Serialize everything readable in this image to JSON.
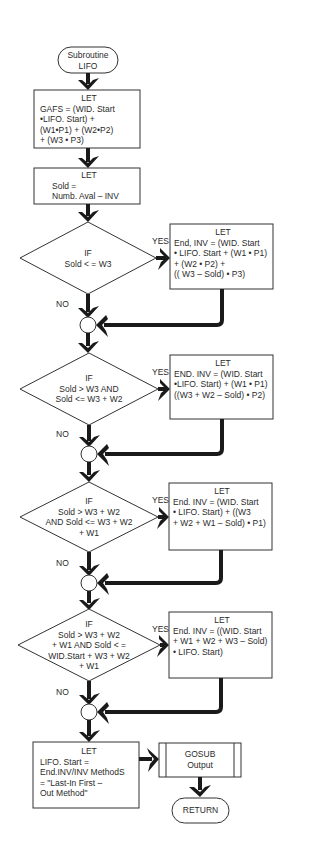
{
  "start": {
    "lines": [
      "Subroutine",
      "LIFO"
    ]
  },
  "steps": [
    {
      "header": "LET",
      "lines": [
        "GAFS = (WID. Start",
        "•LIFO. Start) +",
        "(W1•P1) + (W2•P2)",
        "+ (W3 • P3)"
      ]
    },
    {
      "header": "LET",
      "lines": [
        "Sold =",
        "Numb. Aval – INV"
      ]
    }
  ],
  "decisions": [
    {
      "lines": [
        "IF",
        "Sold < = W3"
      ],
      "yes_label": "YES",
      "no_label": "NO",
      "action": {
        "header": "LET",
        "lines": [
          "End, INV = (WID. Start",
          "• LIFO. Start + (W1 • P1)",
          "+ (W2 • P2) +",
          "(( W3 – Sold) • P3)"
        ]
      }
    },
    {
      "lines": [
        "IF",
        "Sold > W3  AND",
        "Sold <= W3 + W2"
      ],
      "yes_label": "YES",
      "no_label": "NO",
      "action": {
        "header": "LET",
        "lines": [
          "END. INV = (WID. Start",
          "•LIFO. Start) + (W1 • P1)",
          "((W3 + W2 – Sold) • P2)"
        ]
      }
    },
    {
      "lines": [
        "IF",
        "Sold > W3 + W2",
        "AND Sold <= W3 + W2",
        "+ W1"
      ],
      "yes_label": "YES",
      "no_label": "NO",
      "action": {
        "header": "LET",
        "lines": [
          "End. INV = (WID. Start",
          "• LIFO. Start) + ((W3",
          "+ W2 + W1 – Sold) • P1)"
        ]
      }
    },
    {
      "lines": [
        "IF",
        "Sold > W3 + W2",
        "+ W1 AND Sold < =",
        "WID.Start + W3 + W2",
        "+ W1"
      ],
      "yes_label": "YES",
      "no_label": "NO",
      "action": {
        "header": "LET",
        "lines": [
          "End. INV = ((WID. Start",
          "+ W1 + W2 + W3 – Sold)",
          "• LIFO. Start)"
        ]
      }
    }
  ],
  "final_step": {
    "header": "LET",
    "lines": [
      "LIFO. Start =",
      "End.INV/INV MethodS",
      "= \"Last-In First –",
      "Out Method\""
    ]
  },
  "gosub": {
    "lines": [
      "GOSUB",
      "Output"
    ]
  },
  "end": {
    "label": "RETURN"
  },
  "colors": {
    "line": "#1a1a1a",
    "border": "#333333",
    "background": "#ffffff"
  }
}
